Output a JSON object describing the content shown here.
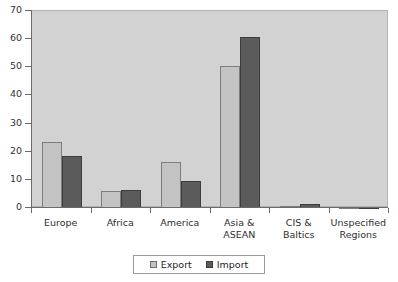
{
  "chart_data": {
    "type": "bar",
    "title": "",
    "xlabel": "",
    "ylabel": "",
    "ylim": [
      0,
      70
    ],
    "yticks": [
      0,
      10,
      20,
      30,
      40,
      50,
      60,
      70
    ],
    "grid": false,
    "legend_position": "bottom",
    "categories": [
      "Europe",
      "Africa",
      "America",
      "Asia &\nASEAN",
      "CIS &\nBaltics",
      "Unspecified\nRegions"
    ],
    "category_lines": [
      [
        "Europe"
      ],
      [
        "Africa"
      ],
      [
        "America"
      ],
      [
        "Asia &",
        "ASEAN"
      ],
      [
        "CIS &",
        "Baltics"
      ],
      [
        "Unspecified",
        "Regions"
      ]
    ],
    "series": [
      {
        "name": "Export",
        "color": "#c3c3c3",
        "values": [
          23.5,
          6.2,
          16.5,
          50.5,
          0.7,
          0.2
        ]
      },
      {
        "name": "Import",
        "color": "#5b5b5b",
        "values": [
          18.5,
          6.4,
          9.6,
          60.8,
          1.4,
          0.3
        ]
      }
    ]
  },
  "legend": {
    "items": [
      {
        "label": "Export",
        "swatch": "export"
      },
      {
        "label": "Import",
        "swatch": "import"
      }
    ]
  },
  "colors": {
    "plot_background": "#d2d2d2",
    "page_background": "#ffffff",
    "axis": "#6b6b6b",
    "export": "#c3c3c3",
    "import": "#5b5b5b"
  }
}
